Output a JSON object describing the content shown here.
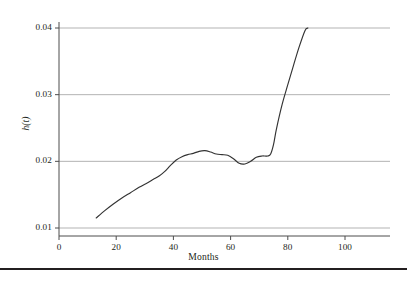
{
  "figure": {
    "background_color": "#ffffff",
    "axis_color": "#4d4d4d",
    "grid_color": "#b3b3b3",
    "curve_color": "#333333",
    "footer_rule_color": "#231f20"
  },
  "axis": {
    "y_title": "h(t)",
    "x_title": "Months",
    "x_ticks": [
      {
        "label": "0",
        "value": 0
      },
      {
        "label": "20",
        "value": 20
      },
      {
        "label": "40",
        "value": 40
      },
      {
        "label": "60",
        "value": 60
      },
      {
        "label": "80",
        "value": 80
      },
      {
        "label": "100",
        "value": 100
      }
    ],
    "y_ticks": [
      {
        "label": "0.01",
        "value": 0.01
      },
      {
        "label": "0.02",
        "value": 0.02
      },
      {
        "label": "0.03",
        "value": 0.03
      },
      {
        "label": "0.04",
        "value": 0.04
      }
    ]
  },
  "chart_data": {
    "type": "line",
    "title": "",
    "subtitle": "",
    "xlabel": "Months",
    "ylabel": "h(t)",
    "xlim": [
      0,
      100
    ],
    "ylim": [
      0.01,
      0.04
    ],
    "xticks": [
      0,
      20,
      40,
      60,
      80,
      100
    ],
    "yticks": [
      0.01,
      0.02,
      0.03,
      0.04
    ],
    "grid": "horizontal",
    "legend": "none",
    "annotations": [],
    "series": [
      {
        "name": "h(t)",
        "color": "#333333",
        "x": [
          13,
          16,
          19,
          22,
          25,
          28,
          31,
          33,
          35,
          37,
          39,
          41,
          43,
          45,
          47,
          49,
          51,
          53,
          55,
          57,
          59,
          61,
          63,
          65,
          67,
          69,
          71,
          72,
          73,
          74,
          75,
          76,
          78,
          80,
          82,
          84,
          86,
          87
        ],
        "y": [
          0.0115,
          0.0126,
          0.0136,
          0.0145,
          0.0153,
          0.0161,
          0.0168,
          0.0173,
          0.0178,
          0.0185,
          0.0194,
          0.0202,
          0.0207,
          0.021,
          0.0212,
          0.0215,
          0.0216,
          0.0214,
          0.0211,
          0.021,
          0.0209,
          0.0204,
          0.0197,
          0.0196,
          0.02,
          0.0206,
          0.0208,
          0.0208,
          0.0208,
          0.0211,
          0.0225,
          0.0248,
          0.0285,
          0.0315,
          0.0344,
          0.0372,
          0.0396,
          0.04
        ]
      }
    ]
  }
}
